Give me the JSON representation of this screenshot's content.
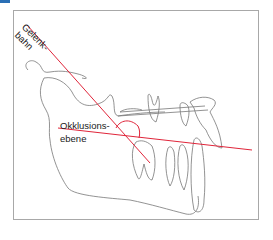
{
  "diagram": {
    "labels": {
      "condylar_path_line1": "Gelenk-",
      "condylar_path_line2": "bahn",
      "occlusal_plane_line1": "Okklusions-",
      "occlusal_plane_line2": "ebene"
    },
    "colors": {
      "reference_lines": "#e0253a",
      "outline": "#777777",
      "frame": "#a8a8a8",
      "corner_accent": "#2a6fb5"
    }
  }
}
